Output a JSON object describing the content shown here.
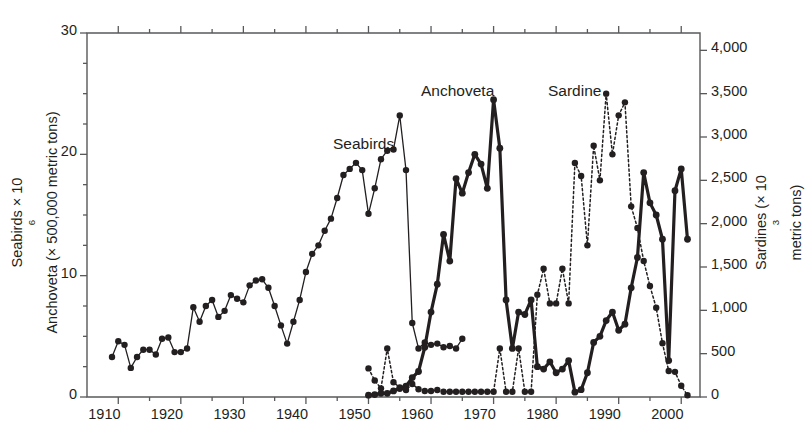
{
  "figure": {
    "left_axis_title_line1": "Seabirds × 10",
    "left_axis_title_line1_sup": "6",
    "left_axis_title_line2": "Anchoveta  (× 500,000 metric tons)",
    "right_axis_title_a": "Sardines  (× 10",
    "right_axis_title_sup": "3",
    "right_axis_title_b": " metric tons)",
    "series_label_seabirds": "Seabirds",
    "series_label_anchoveta": "Anchoveta",
    "series_label_sardine": "Sardine",
    "colors": {
      "ink": "#231f20",
      "axis": "#58595b",
      "plot_bg": "#ffffff"
    }
  },
  "chart_data": {
    "type": "line",
    "title": "",
    "xlabel": "",
    "ylabel": "Seabirds × 10^6 / Anchoveta (× 500,000 metric tons)",
    "y2label": "Sardines (× 10^3 metric tons)",
    "xlim": [
      1905,
      2003
    ],
    "ylim": [
      0,
      30
    ],
    "y2lim": [
      0,
      4200
    ],
    "grid": false,
    "legend": "inline-annotations",
    "xticks": [
      1910,
      1920,
      1930,
      1940,
      1950,
      1960,
      1970,
      1980,
      1990,
      2000
    ],
    "xticks_minor_step": 5,
    "yticks_left": [
      0,
      10,
      20,
      30
    ],
    "yticks_left_minor_step": 2.5,
    "yticks_right": [
      0,
      500,
      1000,
      1500,
      2000,
      2500,
      3000,
      3500,
      4000
    ],
    "yticklabels_right": [
      "0",
      "500",
      "1,000",
      "1,500",
      "2,000",
      "2,500",
      "3,000",
      "3,500",
      "4,000"
    ],
    "series": [
      {
        "name": "Seabirds",
        "axis": "left",
        "style": "thin-solid-with-markers",
        "x": [
          1909,
          1910,
          1911,
          1912,
          1913,
          1914,
          1915,
          1916,
          1917,
          1918,
          1919,
          1920,
          1921,
          1922,
          1923,
          1924,
          1925,
          1926,
          1927,
          1928,
          1929,
          1930,
          1931,
          1932,
          1933,
          1934,
          1935,
          1936,
          1937,
          1938,
          1939,
          1940,
          1941,
          1942,
          1943,
          1944,
          1945,
          1946,
          1947,
          1948,
          1949,
          1950,
          1951,
          1952,
          1953,
          1954,
          1955,
          1956,
          1957,
          1958,
          1959,
          1960,
          1961,
          1962,
          1963,
          1964,
          1965
        ],
        "values": [
          3.3,
          4.6,
          4.3,
          2.4,
          3.3,
          3.9,
          3.9,
          3.5,
          4.8,
          4.9,
          3.7,
          3.7,
          4.0,
          7.4,
          6.2,
          7.5,
          8.0,
          6.6,
          7.1,
          8.4,
          8.1,
          7.8,
          9.2,
          9.6,
          9.7,
          9.0,
          7.5,
          5.9,
          4.4,
          6.2,
          8.0,
          10.3,
          11.8,
          12.5,
          13.7,
          14.7,
          16.4,
          18.3,
          18.8,
          19.3,
          18.7,
          15.1,
          17.2,
          19.6,
          20.3,
          20.4,
          23.2,
          18.7,
          6.1,
          4.0,
          4.5,
          4.3,
          4.4,
          4.1,
          4.2,
          4.0,
          4.8
        ]
      },
      {
        "name": "Anchoveta",
        "axis": "left",
        "style": "thick-solid-with-markers",
        "x": [
          1950,
          1951,
          1952,
          1953,
          1954,
          1955,
          1956,
          1957,
          1958,
          1959,
          1960,
          1961,
          1962,
          1963,
          1964,
          1965,
          1966,
          1967,
          1968,
          1969,
          1970,
          1971,
          1972,
          1973,
          1974,
          1975,
          1976,
          1977,
          1978,
          1979,
          1980,
          1981,
          1982,
          1983,
          1984,
          1985,
          1986,
          1987,
          1988,
          1989,
          1990,
          1991,
          1992,
          1993,
          1994,
          1995,
          1996,
          1997,
          1998,
          1999,
          2000,
          2001
        ],
        "values": [
          0.15,
          0.2,
          0.3,
          0.3,
          0.5,
          0.7,
          0.9,
          1.6,
          2.1,
          4.1,
          7.0,
          9.3,
          13.4,
          11.2,
          18.0,
          16.8,
          18.5,
          20.0,
          19.2,
          17.2,
          24.5,
          20.5,
          8.0,
          4.0,
          7.0,
          6.8,
          8.0,
          2.5,
          2.3,
          2.9,
          2.0,
          2.3,
          3.0,
          0.4,
          0.6,
          2.0,
          4.5,
          5.0,
          6.3,
          7.0,
          5.5,
          6.0,
          9.0,
          11.5,
          18.5,
          16.0,
          15.0,
          13.0,
          3.0,
          17.0,
          18.8,
          13.0
        ]
      },
      {
        "name": "Sardine",
        "axis": "right",
        "style": "dotted-with-markers",
        "x": [
          1950,
          1951,
          1952,
          1953,
          1954,
          1955,
          1956,
          1957,
          1958,
          1959,
          1960,
          1961,
          1962,
          1963,
          1964,
          1965,
          1966,
          1967,
          1968,
          1969,
          1970,
          1971,
          1972,
          1973,
          1974,
          1975,
          1976,
          1977,
          1978,
          1979,
          1980,
          1981,
          1982,
          1983,
          1984,
          1985,
          1986,
          1987,
          1988,
          1989,
          1990,
          1991,
          1992,
          1993,
          1994,
          1995,
          1996,
          1997,
          1998,
          1999,
          2000,
          2001
        ],
        "values": [
          330,
          190,
          100,
          560,
          170,
          110,
          80,
          150,
          90,
          70,
          70,
          80,
          60,
          60,
          60,
          60,
          60,
          60,
          60,
          60,
          60,
          560,
          60,
          60,
          560,
          60,
          60,
          1180,
          1480,
          1080,
          1080,
          1480,
          1080,
          2700,
          2550,
          1750,
          2900,
          2500,
          3500,
          2800,
          3250,
          3400,
          2200,
          1950,
          1570,
          1280,
          1030,
          620,
          300,
          290,
          130,
          20
        ]
      }
    ]
  }
}
